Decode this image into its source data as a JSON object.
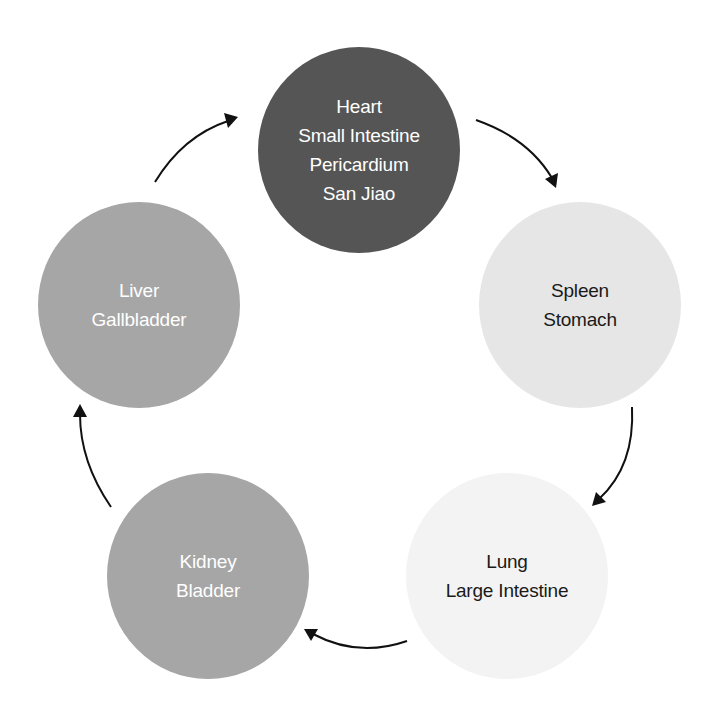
{
  "diagram": {
    "title": "",
    "background_color": "#ffffff",
    "arrow_color": "#111111",
    "nodes": [
      {
        "id": "heart",
        "lines": [
          "Heart",
          "Small Intestine",
          "Pericardium",
          "San Jiao"
        ],
        "fill": "#555555",
        "text_color": "#ffffff",
        "center": [
          359,
          150
        ]
      },
      {
        "id": "spleen",
        "lines": [
          "Spleen",
          "Stomach"
        ],
        "fill": "#e6e6e6",
        "text_color": "#1a1a1a",
        "center": [
          580,
          305
        ]
      },
      {
        "id": "lung",
        "lines": [
          "Lung",
          "Large Intestine"
        ],
        "fill": "#f3f3f3",
        "text_color": "#1a1a1a",
        "center": [
          507,
          576
        ]
      },
      {
        "id": "kidney",
        "lines": [
          "Kidney",
          "Bladder"
        ],
        "fill": "#a6a6a6",
        "text_color": "#ffffff",
        "center": [
          208,
          576
        ]
      },
      {
        "id": "liver",
        "lines": [
          "Liver",
          "Gallbladder"
        ],
        "fill": "#a6a6a6",
        "text_color": "#ffffff",
        "center": [
          139,
          305
        ]
      }
    ],
    "edges": [
      {
        "from": "liver",
        "to": "heart",
        "icon": "curved-arrow-icon"
      },
      {
        "from": "heart",
        "to": "spleen",
        "icon": "curved-arrow-icon"
      },
      {
        "from": "spleen",
        "to": "lung",
        "icon": "curved-arrow-icon"
      },
      {
        "from": "lung",
        "to": "kidney",
        "icon": "curved-arrow-icon"
      },
      {
        "from": "kidney",
        "to": "liver",
        "icon": "curved-arrow-icon"
      }
    ]
  }
}
